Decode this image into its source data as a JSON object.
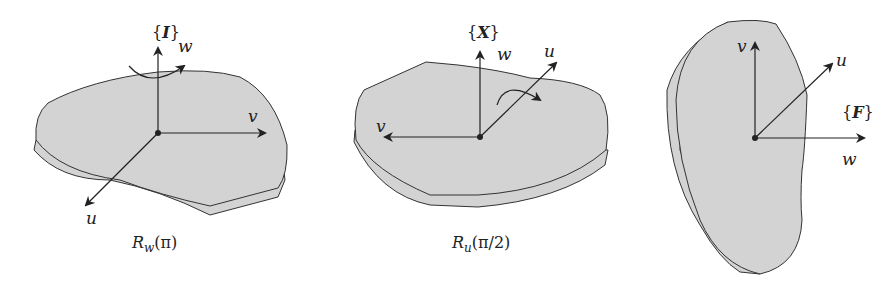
{
  "panels": [
    {
      "id": "initial",
      "frame_label": "{I}",
      "frame_letter": "I",
      "axes": {
        "u": "u",
        "v": "v",
        "w": "w"
      },
      "rotation_arrow_about": "w",
      "caption": {
        "R": "R",
        "sub": "w",
        "arg": "(π)"
      }
    },
    {
      "id": "intermediate",
      "frame_label": "{X}",
      "frame_letter": "X",
      "axes": {
        "u": "u",
        "v": "v",
        "w": "w"
      },
      "rotation_arrow_about": "u",
      "caption": {
        "R": "R",
        "sub": "u",
        "arg": "(π/2)"
      }
    },
    {
      "id": "final",
      "frame_label": "{F}",
      "frame_letter": "F",
      "axes": {
        "u": "u",
        "v": "v",
        "w": "w"
      },
      "caption": null
    }
  ],
  "colors": {
    "plate_fill": "#d3d3d3",
    "edge": "#333333",
    "axis": "#222222"
  }
}
